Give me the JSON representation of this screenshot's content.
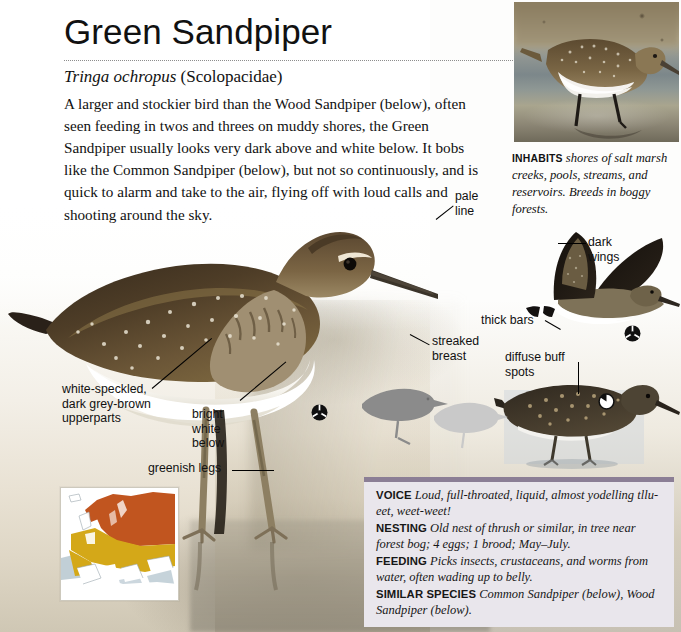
{
  "page": {
    "title": "Green Sandpiper",
    "scientific_name": "Tringa ochropus",
    "family": "(Scolopacidae)",
    "intro": "A larger and stockier bird than the Wood Sandpiper (below), often seen feeding in twos and threes on muddy shores, the Green Sandpiper usually looks very dark above and white below. It bobs like the Common Sandpiper (below), but not so continuously, and is quick to alarm and take to the air, flying off with loud calls and shooting around the sky."
  },
  "inhabits": {
    "label": "INHABITS",
    "text": "shores of salt marsh creeks, pools, streams, and reservoirs. Breeds in boggy forests."
  },
  "callouts": {
    "pale_line": "pale\nline",
    "streaked_breast": "streaked\nbreast",
    "white_speckled": "white-speckled,\ndark grey-brown\nupperparts",
    "bright_white": "bright\nwhite\nbelow",
    "greenish_legs": "greenish legs",
    "dark_wings": "dark\nwings",
    "thick_bars": "thick bars",
    "diffuse_buff": "diffuse buff\nspots"
  },
  "factbox": {
    "entries": [
      {
        "label": "VOICE",
        "text": "Loud, full-throated, liquid, almost yodelling tllu-eet, weet-weet!"
      },
      {
        "label": "NESTING",
        "text": "Old nest of thrush or similar, in tree near forest bog; 4 eggs; 1 brood; May–July."
      },
      {
        "label": "FEEDING",
        "text": "Picks insects, crustaceans, and worms from water, often wading up to belly."
      },
      {
        "label": "SIMILAR SPECIES",
        "text": "Common Sandpiper (below), Wood Sandpiper (below)."
      }
    ]
  },
  "map": {
    "breeding_color": "#c1551f",
    "resident_color": "#d4a818",
    "sea_color": "#8ea7b5",
    "land_color": "#ffffff"
  },
  "colors": {
    "factbox_bg": "#e9e6ec",
    "factbox_bar": "#8b7e95",
    "page_bg": "#fdfdfc",
    "text": "#111111",
    "rule": "#8d8d8d"
  },
  "icons": {
    "plumage_dark": "plumage-indicator-dark",
    "plumage_light": "plumage-indicator-light"
  }
}
